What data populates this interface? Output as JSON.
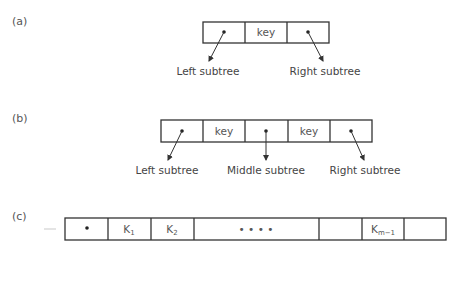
{
  "panels": {
    "a": {
      "label": "(a)",
      "keys": [
        "key"
      ],
      "subtrees": [
        "Left subtree",
        "Right subtree"
      ]
    },
    "b": {
      "label": "(b)",
      "keys": [
        "key",
        "key"
      ],
      "subtrees": [
        "Left subtree",
        "Middle subtree",
        "Right subtree"
      ]
    },
    "c": {
      "label": "(c)",
      "keys": [
        "K",
        "K",
        "• • • •",
        "K"
      ],
      "key_subscripts": [
        "1",
        "2",
        "",
        "m−1"
      ],
      "subtrees": [
        "S",
        "S",
        "S",
        "S"
      ],
      "subtree_subscripts": [
        "0",
        "1",
        "m−2",
        "m−1"
      ]
    }
  },
  "caption": "Figure 14.11"
}
